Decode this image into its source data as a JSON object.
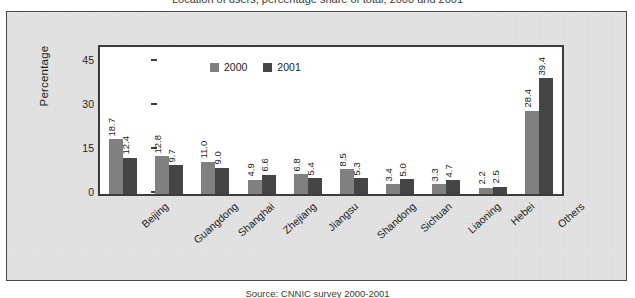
{
  "caption": "Location of users, percentage share of total, 2000 and 2001",
  "source": "Source:  CNNIC survey 2000-2001",
  "legend": {
    "series": [
      {
        "name": "2000",
        "color": "#808080"
      },
      {
        "name": "2001",
        "color": "#454545"
      }
    ]
  },
  "axis": {
    "ylabel": "Percentage",
    "yticks": [
      "0",
      "15",
      "30",
      "45"
    ]
  },
  "chart_data": {
    "type": "bar",
    "title": "Location of users, percentage share of total, 2000 and 2001",
    "xlabel": "",
    "ylabel": "Percentage",
    "ylim": [
      0,
      50
    ],
    "yticks": [
      0,
      15,
      30,
      45
    ],
    "grid": false,
    "legend_position": "top-center",
    "categories": [
      "Beijing",
      "Guangdong",
      "Shanghai",
      "Zhejiang",
      "Jiangsu",
      "Shandong",
      "Sichuan",
      "Liaoning",
      "Hebei",
      "Others"
    ],
    "series": [
      {
        "name": "2000",
        "color": "#808080",
        "values": [
          18.7,
          12.8,
          11.0,
          4.9,
          6.8,
          8.5,
          3.4,
          3.3,
          2.2,
          28.4
        ]
      },
      {
        "name": "2001",
        "color": "#454545",
        "values": [
          12.4,
          9.7,
          9.0,
          6.6,
          5.4,
          5.3,
          5.0,
          4.7,
          2.5,
          39.4
        ]
      }
    ],
    "annotations": [
      "Source:  CNNIC survey 2000-2001"
    ]
  }
}
